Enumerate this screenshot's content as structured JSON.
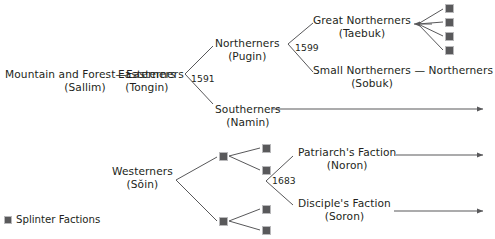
{
  "diagram": {
    "type": "genealogy-tree",
    "line_color": "#58585a",
    "splinter_color": "#59595b",
    "text_color": "#231f20",
    "nodes": [
      {
        "id": "sallim",
        "name": "Mountain and Forest—Easterners",
        "romanization": "(Sallim)",
        "x": 5,
        "y": 68
      },
      {
        "id": "tongin",
        "name": "Easterners",
        "romanization": "(Tongin)",
        "x": 118,
        "y": 68
      },
      {
        "id": "pugin",
        "name": "Northerners",
        "romanization": "(Pugin)",
        "x": 215,
        "y": 37
      },
      {
        "id": "namin",
        "name": "Southerners",
        "romanization": "(Namin)",
        "x": 215,
        "y": 103
      },
      {
        "id": "taebuk",
        "name": "Great Northerners",
        "romanization": "(Taebuk)",
        "x": 313,
        "y": 14
      },
      {
        "id": "sobuk",
        "name": "Small Northerners — Northerners",
        "romanization": "(Sobuk)",
        "x": 313,
        "y": 64
      },
      {
        "id": "soin",
        "name": "Westerners",
        "romanization": "(Sŏin)",
        "x": 112,
        "y": 165
      },
      {
        "id": "noron",
        "name": "Patriarch's Faction",
        "romanization": "(Noron)",
        "x": 298,
        "y": 146
      },
      {
        "id": "soron",
        "name": "Disciple's Faction",
        "romanization": "(Soron)",
        "x": 298,
        "y": 197
      }
    ],
    "dates": [
      {
        "id": "date-1591",
        "label": "1591",
        "x": 191,
        "y": 73
      },
      {
        "id": "date-1599",
        "label": "1599",
        "x": 295,
        "y": 42
      },
      {
        "id": "date-1683",
        "label": "1683",
        "x": 272,
        "y": 175
      }
    ],
    "splinters": [
      {
        "id": "splinter-taebuk-1",
        "x": 445,
        "y": 4
      },
      {
        "id": "splinter-taebuk-2",
        "x": 445,
        "y": 18
      },
      {
        "id": "splinter-taebuk-3",
        "x": 445,
        "y": 32
      },
      {
        "id": "splinter-taebuk-4",
        "x": 445,
        "y": 46
      },
      {
        "id": "splinter-west-upper",
        "x": 219,
        "y": 152
      },
      {
        "id": "splinter-west-upper-a",
        "x": 262,
        "y": 144
      },
      {
        "id": "splinter-west-upper-b",
        "x": 262,
        "y": 166
      },
      {
        "id": "splinter-west-lower",
        "x": 219,
        "y": 217
      },
      {
        "id": "splinter-west-lower-a",
        "x": 262,
        "y": 205
      },
      {
        "id": "splinter-west-lower-b",
        "x": 262,
        "y": 226
      }
    ],
    "legend": {
      "label": "Splinter Factions"
    }
  }
}
